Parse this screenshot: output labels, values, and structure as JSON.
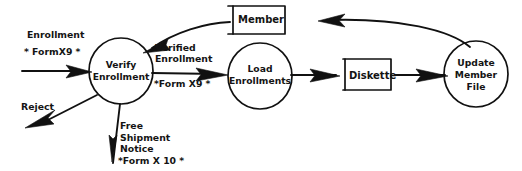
{
  "diagram": {
    "type": "data-flow-diagram",
    "style": "hand-drawn",
    "ink_color": "#111111",
    "background_color": "#ffffff",
    "processes": [
      {
        "id": "verify-enrollment",
        "label_line1": "Verify",
        "label_line2": "Enrollment"
      },
      {
        "id": "load-enrollments",
        "label_line1": "Load",
        "label_line2": "Enrollments"
      },
      {
        "id": "update-member-file",
        "label_line1": "Update",
        "label_line2": "Member",
        "label_line3": "File"
      }
    ],
    "stores": [
      {
        "id": "member-store",
        "label": "Member"
      },
      {
        "id": "diskette-store",
        "label": "Diskette"
      }
    ],
    "flows": [
      {
        "id": "enrollment-in",
        "label": "Enrollment",
        "form": "* FormX9 *",
        "from": "external",
        "to": "verify-enrollment"
      },
      {
        "id": "reject-out",
        "label": "Reject",
        "form": "",
        "from": "verify-enrollment",
        "to": "external"
      },
      {
        "id": "free-shipment-notice",
        "label_line1": "Free",
        "label_line2": "Shipment",
        "label_line3": "Notice",
        "form": "*Form X 10 *",
        "from": "verify-enrollment",
        "to": "external"
      },
      {
        "id": "verified-enrollment",
        "label_line1": "Verified",
        "label_line2": "Enrollment",
        "form": "*Form X9 *",
        "from": "verify-enrollment",
        "to": "load-enrollments"
      },
      {
        "id": "member-lookup",
        "label": "",
        "from": "member-store",
        "to": "verify-enrollment"
      },
      {
        "id": "enrollments-to-diskette",
        "label": "",
        "from": "load-enrollments",
        "to": "diskette-store"
      },
      {
        "id": "diskette-to-update",
        "label": "",
        "from": "diskette-store",
        "to": "update-member-file"
      },
      {
        "id": "update-to-member",
        "label": "",
        "from": "update-member-file",
        "to": "member-store"
      }
    ]
  }
}
